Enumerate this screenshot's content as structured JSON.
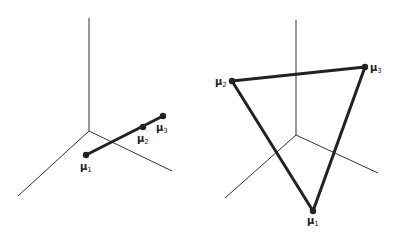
{
  "figure": {
    "panels": [
      {
        "id": "left",
        "description": "Collinear means in 3D",
        "points": [
          {
            "name": "mu1",
            "symbol": "μ",
            "subscript": "1"
          },
          {
            "name": "mu2",
            "symbol": "μ",
            "subscript": "2"
          },
          {
            "name": "mu3",
            "symbol": "μ",
            "subscript": "3"
          }
        ]
      },
      {
        "id": "right",
        "description": "Means forming a triangle in 3D",
        "points": [
          {
            "name": "mu1",
            "symbol": "μ",
            "subscript": "1"
          },
          {
            "name": "mu2",
            "symbol": "μ",
            "subscript": "2"
          },
          {
            "name": "mu3",
            "symbol": "μ",
            "subscript": "3"
          }
        ]
      }
    ]
  }
}
